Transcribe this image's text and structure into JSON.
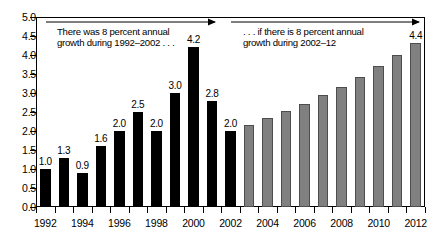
{
  "chart_data": {
    "type": "bar",
    "title": "",
    "subtitle": "",
    "xlabel": "",
    "ylabel": "",
    "ylim": [
      0.0,
      5.0
    ],
    "ytick_step": 0.5,
    "grid": false,
    "legend": "none",
    "x": [
      1992,
      1993,
      1994,
      1995,
      1996,
      1997,
      1998,
      1999,
      2000,
      2001,
      2002,
      2003,
      2004,
      2005,
      2006,
      2007,
      2008,
      2009,
      2010,
      2011,
      2012
    ],
    "categories": [
      "1992",
      "1993",
      "1994",
      "1995",
      "1996",
      "1997",
      "1998",
      "1999",
      "2000",
      "2001",
      "2002",
      "2003",
      "2004",
      "2005",
      "2006",
      "2007",
      "2008",
      "2009",
      "2010",
      "2011",
      "2012"
    ],
    "values": [
      1.0,
      1.3,
      0.9,
      1.6,
      2.0,
      2.5,
      2.0,
      3.0,
      4.2,
      2.8,
      2.0,
      2.16,
      2.33,
      2.52,
      2.72,
      2.94,
      3.17,
      3.43,
      3.7,
      4.0,
      4.32
    ],
    "series": [
      {
        "name": "actual",
        "color": "#000000",
        "points": [
          {
            "x": "1992",
            "y": 1.0,
            "label": "1.0"
          },
          {
            "x": "1993",
            "y": 1.3,
            "label": "1.3"
          },
          {
            "x": "1994",
            "y": 0.9,
            "label": "0.9"
          },
          {
            "x": "1995",
            "y": 1.6,
            "label": "1.6"
          },
          {
            "x": "1996",
            "y": 2.0,
            "label": "2.0"
          },
          {
            "x": "1997",
            "y": 2.5,
            "label": "2.5"
          },
          {
            "x": "1998",
            "y": 2.0,
            "label": "2.0"
          },
          {
            "x": "1999",
            "y": 3.0,
            "label": "3.0"
          },
          {
            "x": "2000",
            "y": 4.2,
            "label": "4.2"
          },
          {
            "x": "2001",
            "y": 2.8,
            "label": "2.8"
          },
          {
            "x": "2002",
            "y": 2.0,
            "label": "2.0"
          }
        ]
      },
      {
        "name": "projected",
        "color": "#808080",
        "points": [
          {
            "x": "2003",
            "y": 2.16,
            "label": ""
          },
          {
            "x": "2004",
            "y": 2.33,
            "label": ""
          },
          {
            "x": "2005",
            "y": 2.52,
            "label": ""
          },
          {
            "x": "2006",
            "y": 2.72,
            "label": ""
          },
          {
            "x": "2007",
            "y": 2.94,
            "label": ""
          },
          {
            "x": "2008",
            "y": 3.17,
            "label": ""
          },
          {
            "x": "2009",
            "y": 3.43,
            "label": ""
          },
          {
            "x": "2010",
            "y": 3.7,
            "label": ""
          },
          {
            "x": "2011",
            "y": 4.0,
            "label": ""
          },
          {
            "x": "2012",
            "y": 4.32,
            "label": "4.4"
          }
        ]
      }
    ],
    "ytick_labels": [
      "0.0",
      "0.5",
      "1.0",
      "1.5",
      "2.0",
      "2.5",
      "3.0",
      "3.5",
      "4.0",
      "4.5",
      "5.0"
    ],
    "ytick_values": [
      0.0,
      0.5,
      1.0,
      1.5,
      2.0,
      2.5,
      3.0,
      3.5,
      4.0,
      4.5,
      5.0
    ],
    "xtick_labels": [
      "1992",
      "1994",
      "1996",
      "1998",
      "2000",
      "2002",
      "2004",
      "2006",
      "2008",
      "2010",
      "2012"
    ],
    "xtick_values": [
      1992,
      1994,
      1996,
      1998,
      2000,
      2002,
      2004,
      2006,
      2008,
      2010,
      2012
    ],
    "annotations": [
      {
        "name": "left",
        "text": "There was 8 percent annual\ngrowth during 1992–2002 . . .",
        "arrow_from": 1992,
        "arrow_to": 2002
      },
      {
        "name": "right",
        "text": ". . . if there is 8 percent annual\ngrowth during 2002–12",
        "arrow_from": 2002,
        "arrow_to": 2012
      }
    ],
    "colors": {
      "actual_bar": "#000000",
      "projected_bar": "#808080",
      "projected_bar_outline": "#4d4d4d",
      "axis": "#000000",
      "background": "#ffffff"
    }
  }
}
